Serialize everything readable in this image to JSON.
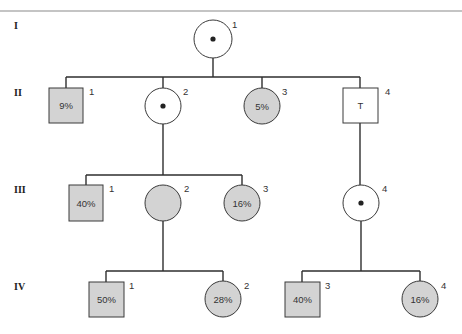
{
  "pedigree": {
    "generations": [
      {
        "label": "I",
        "individuals": [
          {
            "number": "1",
            "sex": "female",
            "affected": false,
            "carrier_dot": true,
            "text": ""
          }
        ]
      },
      {
        "label": "II",
        "individuals": [
          {
            "number": "1",
            "sex": "male",
            "affected": true,
            "carrier_dot": false,
            "text": "9%"
          },
          {
            "number": "2",
            "sex": "female",
            "affected": false,
            "carrier_dot": true,
            "text": ""
          },
          {
            "number": "3",
            "sex": "female",
            "affected": true,
            "carrier_dot": false,
            "text": "5%"
          },
          {
            "number": "4",
            "sex": "male",
            "affected": false,
            "carrier_dot": false,
            "text": "T"
          }
        ]
      },
      {
        "label": "III",
        "individuals": [
          {
            "number": "1",
            "sex": "male",
            "affected": true,
            "carrier_dot": false,
            "text": "40%"
          },
          {
            "number": "2",
            "sex": "female",
            "affected": true,
            "carrier_dot": false,
            "text": ""
          },
          {
            "number": "3",
            "sex": "female",
            "affected": true,
            "carrier_dot": false,
            "text": "16%"
          },
          {
            "number": "4",
            "sex": "female",
            "affected": false,
            "carrier_dot": true,
            "text": ""
          }
        ]
      },
      {
        "label": "IV",
        "individuals": [
          {
            "number": "1",
            "sex": "male",
            "affected": true,
            "carrier_dot": false,
            "text": "50%"
          },
          {
            "number": "2",
            "sex": "female",
            "affected": true,
            "carrier_dot": false,
            "text": "28%"
          },
          {
            "number": "3",
            "sex": "male",
            "affected": true,
            "carrier_dot": false,
            "text": "40%"
          },
          {
            "number": "4",
            "sex": "female",
            "affected": true,
            "carrier_dot": false,
            "text": "16%"
          }
        ]
      }
    ],
    "colors": {
      "affected_fill": "#d3d3d3",
      "unaffected_fill": "#ffffff",
      "line": "#2e2e2e"
    }
  }
}
